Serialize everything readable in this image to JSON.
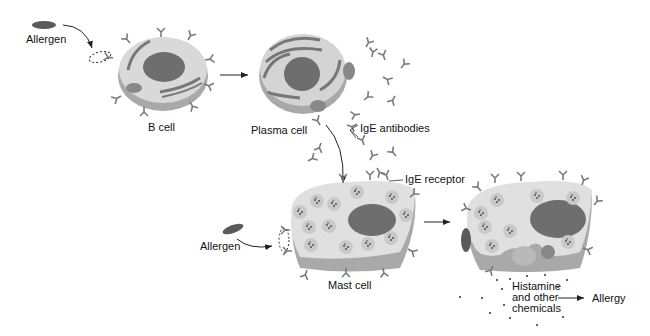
{
  "diagram": {
    "labels": {
      "allergen_top": "Allergen",
      "b_cell": "B cell",
      "plasma_cell": "Plasma cell",
      "ige_antibodies": "IgE antibodies",
      "ige_receptor": "IgE receptor",
      "allergen_bottom": "Allergen",
      "mast_cell": "Mast cell",
      "histamine_line1": "Histamine",
      "histamine_line2": "and other",
      "histamine_line3": "chemicals",
      "allergy": "Allergy"
    },
    "colors": {
      "cell_body": "#d9d9d9",
      "cell_shadow": "#a9a9a9",
      "nucleus": "#6e6e6e",
      "antibody": "#7a7a7a",
      "allergen": "#5a5a5a",
      "arrow": "#222222"
    },
    "flow": [
      "Allergen -> B cell",
      "B cell -> Plasma cell",
      "Plasma cell -> IgE antibodies",
      "IgE antibodies -> Mast cell (IgE receptor)",
      "Allergen -> Mast cell",
      "Mast cell -> Degranulating mast cell",
      "Histamine and other chemicals -> Allergy"
    ]
  }
}
